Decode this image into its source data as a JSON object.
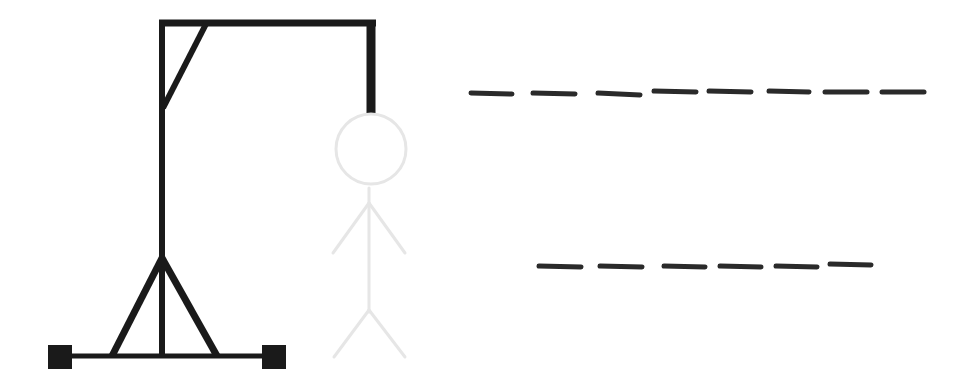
{
  "game": {
    "title": "Hangman",
    "mistakes_shown": "0",
    "word_rows": [
      {
        "letters": [
          "",
          "",
          "",
          "",
          "",
          "",
          "",
          ""
        ],
        "length": 8
      },
      {
        "letters": [
          "",
          "",
          "",
          "",
          "",
          ""
        ],
        "length": 6
      }
    ]
  },
  "colors": {
    "gallows": "#1a1a1a",
    "figure_outline": "#e6e6e6",
    "blank": "#2a2a2a",
    "background": "#ffffff"
  },
  "icons": {
    "gallows": "gallows-icon",
    "figure": "stick-figure-icon"
  }
}
